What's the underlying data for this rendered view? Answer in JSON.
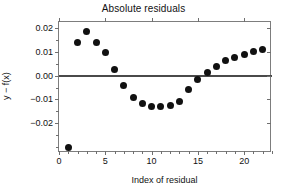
{
  "chart_data": {
    "type": "scatter",
    "title": "Absolute residuals",
    "xlabel": "Index of residual",
    "ylabel": "y − f(x)",
    "grid": false,
    "legend": "none",
    "xlim": [
      0,
      23
    ],
    "ylim": [
      -0.0324,
      0.0224
    ],
    "xticks": [
      0,
      5,
      10,
      15,
      20
    ],
    "xtick_labels": [
      "0",
      "5",
      "10",
      "15",
      "20"
    ],
    "yticks": [
      0.02,
      0.01,
      0.0,
      -0.01,
      -0.02
    ],
    "ytick_labels": [
      "0.02",
      "0.01",
      "0.00",
      "−0.01",
      "−0.02"
    ],
    "x": [
      1,
      2,
      3,
      4,
      5,
      6,
      7,
      8,
      9,
      10,
      11,
      12,
      13,
      14,
      15,
      16,
      17,
      18,
      19,
      20,
      21,
      22
    ],
    "values": [
      -0.03,
      0.014,
      0.0184,
      0.014,
      0.0096,
      0.0026,
      -0.0042,
      -0.0092,
      -0.0118,
      -0.013,
      -0.0131,
      -0.0124,
      -0.0108,
      -0.0057,
      -0.0018,
      0.0012,
      0.0039,
      0.0061,
      0.0077,
      0.0089,
      0.0101,
      0.0111
    ],
    "series": [
      {
        "name": "residuals",
        "marker": "filled-circle",
        "color": "#111111",
        "values": [
          -0.03,
          0.014,
          0.0184,
          0.014,
          0.0096,
          0.0026,
          -0.0042,
          -0.0092,
          -0.0118,
          -0.013,
          -0.0131,
          -0.0124,
          -0.0108,
          -0.0057,
          -0.0018,
          0.0012,
          0.0039,
          0.0061,
          0.0077,
          0.0089,
          0.0101,
          0.0111
        ]
      }
    ],
    "annotations": [
      {
        "name": "zero-reference-line",
        "type": "hline",
        "y": 0.0,
        "x_start": 0.0,
        "x_end": 23.0,
        "color": "#4a4a4a"
      }
    ],
    "colors": {
      "marker": "#111111",
      "zero_line": "#4a4a4a",
      "axis": "#7d7d7d",
      "text": "#111111",
      "background": "#ffffff"
    }
  }
}
